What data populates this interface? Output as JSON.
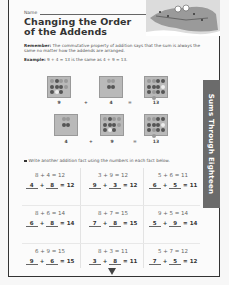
{
  "header": {
    "name_label": "Name",
    "title_line1": "Changing the Order",
    "title_line2": "of the Addends"
  },
  "remember": {
    "label": "Remember:",
    "text": " The commutative property of addition says that the sum is always the same no matter how the addends are arranged."
  },
  "example": {
    "label": "Example:",
    "text": " 9 + 4 = 13 is the same as 4 + 9 = 13."
  },
  "example_rows": [
    {
      "a": "9",
      "op1": "+",
      "b": "4",
      "op2": "=",
      "sum": "13"
    },
    {
      "a": "4",
      "op1": "+",
      "b": "9",
      "op2": "=",
      "sum": "13"
    }
  ],
  "instruction": "Write another addition fact using the numbers in each fact below.",
  "side_tab": "Sums Through Eighteen",
  "problems": [
    {
      "fact": "8 + 4 = 12",
      "a": "4",
      "b": "8",
      "sum": "12"
    },
    {
      "fact": "3 + 9 = 12",
      "a": "9",
      "b": "3",
      "sum": "12"
    },
    {
      "fact": "5 + 6 = 11",
      "a": "6",
      "b": "5",
      "sum": "11"
    },
    {
      "fact": "8 + 6 = 14",
      "a": "6",
      "b": "8",
      "sum": "14"
    },
    {
      "fact": "8 + 7 = 15",
      "a": "7",
      "b": "8",
      "sum": "15"
    },
    {
      "fact": "9 + 5 = 14",
      "a": "5",
      "b": "9",
      "sum": "14"
    },
    {
      "fact": "6 + 9 = 15",
      "a": "9",
      "b": "6",
      "sum": "15"
    },
    {
      "fact": "8 + 3 = 11",
      "a": "3",
      "b": "8",
      "sum": "11"
    },
    {
      "fact": "5 + 7 = 12",
      "a": "7",
      "b": "5",
      "sum": "12"
    }
  ],
  "symbols": {
    "plus": "+",
    "equals": "="
  },
  "icons": {
    "next_page": "down-triangle-icon",
    "illustration": "alligator-illustration"
  }
}
